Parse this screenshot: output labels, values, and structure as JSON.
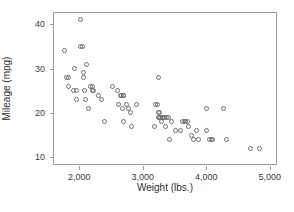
{
  "chart_data": {
    "type": "scatter",
    "title": "",
    "xlabel": "Weight (lbs.)",
    "ylabel": "Mileage (mpg)",
    "xlim": [
      1600,
      5100
    ],
    "ylim": [
      8.5,
      42.5
    ],
    "xticks": [
      2000,
      3000,
      4000,
      5000
    ],
    "xticklabels": [
      "2,000",
      "3,000",
      "4,000",
      "5,000"
    ],
    "yticks": [
      10,
      20,
      30,
      40
    ],
    "yticklabels": [
      "10",
      "20",
      "30",
      "40"
    ],
    "grid": false,
    "legend": null,
    "marker": "open-circle",
    "marker_color": "#6f6f6f",
    "points": [
      [
        1760,
        34
      ],
      [
        1800,
        28
      ],
      [
        1830,
        28
      ],
      [
        1830,
        26
      ],
      [
        1900,
        25
      ],
      [
        1930,
        30
      ],
      [
        1950,
        25
      ],
      [
        1960,
        23
      ],
      [
        2020,
        41
      ],
      [
        2020,
        35
      ],
      [
        2050,
        35
      ],
      [
        2060,
        29
      ],
      [
        2070,
        28
      ],
      [
        2080,
        25
      ],
      [
        2100,
        23
      ],
      [
        2120,
        31
      ],
      [
        2150,
        21
      ],
      [
        2180,
        26
      ],
      [
        2200,
        26
      ],
      [
        2210,
        25
      ],
      [
        2230,
        25
      ],
      [
        2300,
        24
      ],
      [
        2350,
        23
      ],
      [
        2400,
        18
      ],
      [
        2520,
        26
      ],
      [
        2600,
        25
      ],
      [
        2620,
        22
      ],
      [
        2650,
        24
      ],
      [
        2660,
        24
      ],
      [
        2680,
        21
      ],
      [
        2690,
        24
      ],
      [
        2700,
        24
      ],
      [
        2700,
        18
      ],
      [
        2740,
        22
      ],
      [
        2780,
        21
      ],
      [
        2800,
        20
      ],
      [
        2820,
        17
      ],
      [
        2900,
        22
      ],
      [
        3180,
        17
      ],
      [
        3200,
        22
      ],
      [
        3230,
        22
      ],
      [
        3240,
        28
      ],
      [
        3250,
        19
      ],
      [
        3250,
        20
      ],
      [
        3260,
        19
      ],
      [
        3270,
        20
      ],
      [
        3280,
        19
      ],
      [
        3300,
        18
      ],
      [
        3310,
        19
      ],
      [
        3330,
        19
      ],
      [
        3340,
        19
      ],
      [
        3360,
        17
      ],
      [
        3380,
        19
      ],
      [
        3400,
        19
      ],
      [
        3420,
        14
      ],
      [
        3450,
        18
      ],
      [
        3520,
        16
      ],
      [
        3600,
        16
      ],
      [
        3620,
        18
      ],
      [
        3650,
        18
      ],
      [
        3680,
        18
      ],
      [
        3700,
        18
      ],
      [
        3720,
        17
      ],
      [
        3760,
        15
      ],
      [
        3800,
        14
      ],
      [
        3850,
        16
      ],
      [
        3880,
        14
      ],
      [
        4000,
        21
      ],
      [
        4010,
        16
      ],
      [
        4050,
        14
      ],
      [
        4080,
        14
      ],
      [
        4100,
        14
      ],
      [
        4280,
        21
      ],
      [
        4320,
        14
      ],
      [
        4700,
        12
      ],
      [
        4840,
        12
      ]
    ]
  }
}
